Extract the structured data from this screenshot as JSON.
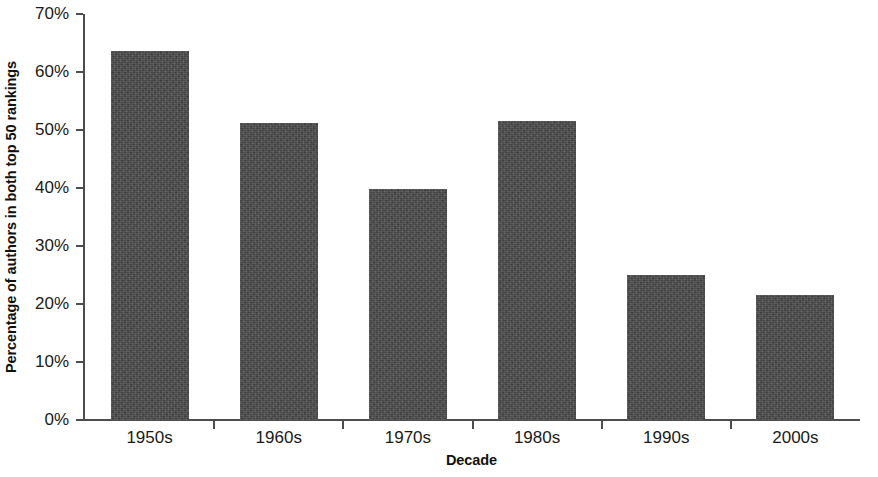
{
  "chart_data": {
    "type": "bar",
    "title": "",
    "subtitle": "",
    "xlabel": "Decade",
    "ylabel": "Percentage of authors in both top 50 rankings",
    "categories": [
      "1950s",
      "1960s",
      "1970s",
      "1980s",
      "1990s",
      "2000s"
    ],
    "values": [
      63.7,
      51.2,
      39.8,
      51.5,
      25.0,
      21.5
    ],
    "series": [
      {
        "name": "Percentage of authors in both top 50 rankings",
        "values": [
          63.7,
          51.2,
          39.8,
          51.5,
          25.0,
          21.5
        ]
      }
    ],
    "ylim": [
      0,
      70
    ],
    "ytick_labels": [
      "0%",
      "10%",
      "20%",
      "30%",
      "40%",
      "50%",
      "60%",
      "70%"
    ],
    "ytick_values": [
      0,
      10,
      20,
      30,
      40,
      50,
      60,
      70
    ],
    "grid": false,
    "legend": false,
    "legend_position": "none",
    "bar_color": "#4a4a4a",
    "axis_color": "#4d4d4d",
    "background_color": "#ffffff",
    "value_unit": "%"
  }
}
